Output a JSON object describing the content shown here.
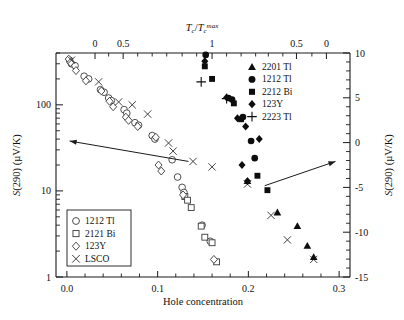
{
  "figure": {
    "title": "",
    "bottom_axis_label": "Hole concentration",
    "left_axis_label": "S(290) (µV/K)",
    "right_axis_label": "S(290) (µV/K)",
    "top_axis_label": "Tc/Tc max"
  },
  "legend_filled": {
    "entries": [
      {
        "label": "2201 Tl",
        "marker": "triangle-filled"
      },
      {
        "label": "1212 Tl",
        "marker": "circle-filled"
      },
      {
        "label": "2212 Bi",
        "marker": "square-filled"
      },
      {
        "label": "123Y",
        "marker": "diamond-filled"
      },
      {
        "label": "2223 Tl",
        "marker": "plus"
      }
    ]
  },
  "legend_open": {
    "entries": [
      {
        "label": "1212 Tl",
        "marker": "circle-open"
      },
      {
        "label": "2121 Bi",
        "marker": "square-open"
      },
      {
        "label": "123Y",
        "marker": "diamond-open"
      },
      {
        "label": "LSCO",
        "marker": "cross"
      }
    ]
  },
  "chart_data": {
    "type": "scatter",
    "title": "",
    "xlabel": "Hole concentration",
    "ylabel": "S(290) (µV/K)",
    "y2label": "S(290) (µV/K)",
    "top_axis_label": "Tc/Tc max",
    "grid": false,
    "xlim": [
      -0.012,
      0.312
    ],
    "xticks": [
      0.0,
      0.1,
      0.2,
      0.3
    ],
    "xticklabels": [
      "0.0",
      "0.1",
      "0.2",
      "0.3"
    ],
    "xminor_step": 0.02,
    "yscale": "log",
    "ylim": [
      1,
      400
    ],
    "yticks": [
      1,
      10,
      100
    ],
    "yticklabels": [
      "1",
      "10",
      "100"
    ],
    "y2scale": "linear",
    "y2lim": [
      -15,
      10
    ],
    "y2ticks": [
      10,
      5,
      0,
      -5,
      -10,
      -15
    ],
    "y2ticklabels": [
      "10",
      "5",
      "0",
      "-5",
      "-10",
      "-15"
    ],
    "top_axis": {
      "ticklabels": [
        "0",
        "0.5",
        "1",
        "0.5",
        "0"
      ],
      "tickpositions_x": [
        0.031,
        0.062,
        0.16,
        0.253,
        0.286
      ],
      "minor_tickpositions_x": [
        0.046,
        0.078,
        0.094,
        0.11,
        0.127,
        0.143,
        0.176,
        0.192,
        0.208,
        0.222,
        0.238,
        0.27
      ]
    },
    "annotations": [
      {
        "name": "left-arrow",
        "text": "",
        "from": [
          0.134,
          22
        ],
        "to": [
          0.003,
          38
        ],
        "points_to": "left-axis"
      },
      {
        "name": "right-arrow",
        "text": "",
        "from": [
          0.218,
          11.5
        ],
        "to": [
          0.296,
          22
        ],
        "points_to": "right-axis"
      }
    ],
    "series": [
      {
        "name": "1212 Tl (open)",
        "marker": "circle-open",
        "axis": "left",
        "points": [
          [
            0.003,
            330
          ],
          [
            0.005,
            300
          ],
          [
            0.009,
            285
          ],
          [
            0.019,
            215
          ],
          [
            0.024,
            200
          ],
          [
            0.037,
            150
          ],
          [
            0.041,
            140
          ],
          [
            0.046,
            120
          ],
          [
            0.049,
            112
          ],
          [
            0.063,
            88
          ],
          [
            0.066,
            80
          ],
          [
            0.075,
            62
          ],
          [
            0.079,
            58
          ],
          [
            0.094,
            44
          ],
          [
            0.097,
            40
          ],
          [
            0.116,
            23
          ],
          [
            0.127,
            11
          ],
          [
            0.129,
            9.6
          ],
          [
            0.149,
            4.0
          ],
          [
            0.158,
            2.6
          ],
          [
            0.122,
            14.5
          ]
        ]
      },
      {
        "name": "2121 Bi (open)",
        "marker": "square-open",
        "axis": "left",
        "points": [
          [
            0.13,
            8.6
          ],
          [
            0.133,
            7.8
          ],
          [
            0.137,
            6.4
          ],
          [
            0.148,
            3.9
          ],
          [
            0.152,
            2.9
          ],
          [
            0.16,
            2.5
          ],
          [
            0.165,
            1.5
          ]
        ]
      },
      {
        "name": "123Y (open)",
        "marker": "diamond-open",
        "axis": "left",
        "points": [
          [
            0.002,
            340
          ],
          [
            0.004,
            310
          ],
          [
            0.01,
            250
          ],
          [
            0.021,
            190
          ],
          [
            0.038,
            145
          ],
          [
            0.047,
            110
          ],
          [
            0.051,
            95
          ],
          [
            0.065,
            72
          ],
          [
            0.068,
            66
          ],
          [
            0.078,
            56
          ],
          [
            0.098,
            42
          ],
          [
            0.101,
            20
          ],
          [
            0.104,
            17
          ],
          [
            0.128,
            9.0
          ],
          [
            0.162,
            1.6
          ]
        ]
      },
      {
        "name": "LSCO (cross)",
        "marker": "cross",
        "axis": "left",
        "points": [
          [
            0.005,
            330
          ],
          [
            0.035,
            185
          ],
          [
            0.057,
            108
          ],
          [
            0.072,
            100
          ],
          [
            0.089,
            78
          ],
          [
            0.112,
            36
          ],
          [
            0.117,
            29
          ],
          [
            0.139,
            22
          ],
          [
            0.16,
            19
          ],
          [
            0.199,
            12
          ],
          [
            0.225,
            5.2
          ],
          [
            0.243,
            2.7
          ],
          [
            0.272,
            1.6
          ]
        ]
      },
      {
        "name": "1212 Tl (filled)",
        "marker": "circle-filled",
        "axis": "left",
        "points": [
          [
            0.153,
            380
          ],
          [
            0.178,
            120
          ],
          [
            0.194,
            72
          ],
          [
            0.203,
            38
          ],
          [
            0.207,
            24
          ],
          [
            0.182,
            115
          ]
        ]
      },
      {
        "name": "2212 Bi (filled)",
        "marker": "square-filled",
        "axis": "left",
        "points": [
          [
            0.152,
            280
          ],
          [
            0.16,
            200
          ],
          [
            0.184,
            104
          ],
          [
            0.192,
            68
          ],
          [
            0.21,
            15
          ],
          [
            0.221,
            10.2
          ]
        ]
      },
      {
        "name": "123Y (filled)",
        "marker": "diamond-filled",
        "axis": "left",
        "points": [
          [
            0.152,
            320
          ],
          [
            0.176,
            122
          ],
          [
            0.188,
            70
          ],
          [
            0.197,
            56
          ],
          [
            0.193,
            20
          ],
          [
            0.199,
            13
          ],
          [
            0.212,
            40
          ]
        ]
      },
      {
        "name": "2201 Tl (filled)",
        "marker": "triangle-filled",
        "axis": "left",
        "points": [
          [
            0.199,
            13
          ],
          [
            0.232,
            5.6
          ],
          [
            0.254,
            3.9
          ],
          [
            0.265,
            2.3
          ],
          [
            0.272,
            1.7
          ]
        ]
      },
      {
        "name": "2223 Tl (plus)",
        "marker": "plus",
        "axis": "left",
        "points": [
          [
            0.148,
            185
          ],
          [
            0.176,
            118
          ]
        ]
      }
    ]
  }
}
